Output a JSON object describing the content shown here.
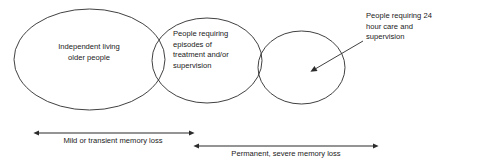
{
  "diagram": {
    "background_color": "#ffffff",
    "stroke_color": "#2b2b2b",
    "text_color": "#1a1a1a",
    "groups": [
      {
        "id": "independent-living",
        "label": "Independent living\nolder people",
        "shape": "ellipse"
      },
      {
        "id": "episodes-treatment",
        "label": "People requiring\nepisodes of\ntreatment and/or\nsupervision",
        "shape": "ellipse"
      },
      {
        "id": "24hour-care",
        "label": "",
        "shape": "ellipse"
      }
    ],
    "callout": {
      "id": "24hour-care-callout",
      "label": "People requiring 24\nhour care and\nsupervision",
      "points_to": "24hour-care"
    },
    "scales": [
      {
        "id": "mild-memory-loss",
        "label": "Mild or transient memory loss",
        "arrow": "double-headed"
      },
      {
        "id": "permanent-memory-loss",
        "label": "Permanent, severe memory loss",
        "arrow": "double-headed"
      }
    ]
  }
}
